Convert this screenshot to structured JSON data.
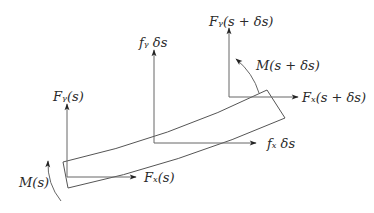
{
  "diagram": {
    "type": "free-body diagram of beam element",
    "colors": {
      "line": "#555555",
      "arrow": "#222222",
      "text": "#2a2a2a"
    },
    "labels": {
      "fy_left": "Fᵧ(s)",
      "fx_left": "Fₓ(s)",
      "m_left": "M(s)",
      "fy_dist": "fᵧ δs",
      "fx_dist": "fₓ δs",
      "fy_right": "Fᵧ(s + δs)",
      "fx_right": "Fₓ(s + δs)",
      "m_right": "M(s + δs)"
    },
    "forces": [
      {
        "name": "Fy(s)",
        "direction": "up",
        "location": "left end"
      },
      {
        "name": "Fx(s)",
        "direction": "right",
        "location": "left end"
      },
      {
        "name": "M(s)",
        "direction": "counterclockwise",
        "location": "left end"
      },
      {
        "name": "fy δs",
        "direction": "up",
        "location": "middle"
      },
      {
        "name": "fx δs",
        "direction": "right",
        "location": "middle"
      },
      {
        "name": "Fy(s + δs)",
        "direction": "up",
        "location": "right end"
      },
      {
        "name": "Fx(s + δs)",
        "direction": "right",
        "location": "right end"
      },
      {
        "name": "M(s + δs)",
        "direction": "counterclockwise",
        "location": "right end"
      }
    ]
  }
}
